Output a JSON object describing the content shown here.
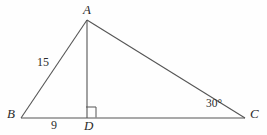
{
  "figure": {
    "type": "geometry-diagram",
    "shape": "triangle-with-altitude",
    "background_color": "#fefefe",
    "stroke_color": "#555555",
    "text_color": "#2b2b2b",
    "width": 267,
    "height": 135
  },
  "vertices": {
    "A": {
      "label": "A",
      "x": 87,
      "y": 20
    },
    "B": {
      "label": "B",
      "x": 21,
      "y": 118
    },
    "C": {
      "label": "C",
      "x": 245,
      "y": 118
    },
    "D": {
      "label": "D",
      "x": 87,
      "y": 118
    }
  },
  "segments": [
    {
      "name": "BA",
      "from": "B",
      "to": "A"
    },
    {
      "name": "AC",
      "from": "A",
      "to": "C"
    },
    {
      "name": "BC",
      "from": "B",
      "to": "C"
    },
    {
      "name": "AD",
      "from": "A",
      "to": "D"
    }
  ],
  "measures": {
    "BA": "15",
    "BD": "9",
    "angle_C": "30°"
  },
  "marks": {
    "right_angle_at": "D",
    "right_angle_symbol": "square"
  }
}
